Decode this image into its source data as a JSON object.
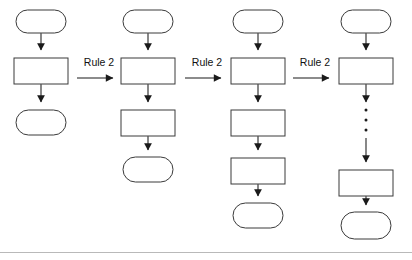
{
  "diagram": {
    "background_color": "#ffffff",
    "shape_fill": "#ffffff",
    "shape_stroke": "#3a3a3a",
    "arrow_color": "#555555",
    "label_color": "#111111",
    "footer_rule_color": "#b9b9b9",
    "ellipsis_glyph": "vertical-three-dots",
    "transitions": [
      {
        "label": "Rule 2"
      },
      {
        "label": "Rule 2"
      },
      {
        "label": "Rule 2"
      }
    ],
    "stages": [
      {
        "name": "stage-1",
        "center_x": 41,
        "nodes": [
          {
            "kind": "terminal",
            "y": 10,
            "w": 50,
            "h": 23
          },
          {
            "kind": "process",
            "y": 58,
            "w": 54,
            "h": 26
          },
          {
            "kind": "terminal",
            "y": 110,
            "w": 50,
            "h": 25
          }
        ]
      },
      {
        "name": "stage-2",
        "center_x": 148,
        "nodes": [
          {
            "kind": "terminal",
            "y": 10,
            "w": 50,
            "h": 23
          },
          {
            "kind": "process",
            "y": 58,
            "w": 54,
            "h": 26
          },
          {
            "kind": "process",
            "y": 110,
            "w": 54,
            "h": 26
          },
          {
            "kind": "terminal",
            "y": 157,
            "w": 50,
            "h": 25
          }
        ]
      },
      {
        "name": "stage-3",
        "center_x": 258,
        "nodes": [
          {
            "kind": "terminal",
            "y": 10,
            "w": 50,
            "h": 23
          },
          {
            "kind": "process",
            "y": 58,
            "w": 54,
            "h": 26
          },
          {
            "kind": "process",
            "y": 110,
            "w": 54,
            "h": 26
          },
          {
            "kind": "process",
            "y": 158,
            "w": 54,
            "h": 26
          },
          {
            "kind": "terminal",
            "y": 203,
            "w": 50,
            "h": 25
          }
        ]
      },
      {
        "name": "stage-4",
        "center_x": 366,
        "nodes": [
          {
            "kind": "terminal",
            "y": 10,
            "w": 50,
            "h": 23
          },
          {
            "kind": "process",
            "y": 58,
            "w": 54,
            "h": 26
          },
          {
            "kind": "ellipsis",
            "y": 104,
            "w": 0,
            "h": 34
          },
          {
            "kind": "process",
            "y": 170,
            "w": 54,
            "h": 26
          },
          {
            "kind": "terminal",
            "y": 212,
            "w": 50,
            "h": 27
          }
        ]
      }
    ]
  }
}
